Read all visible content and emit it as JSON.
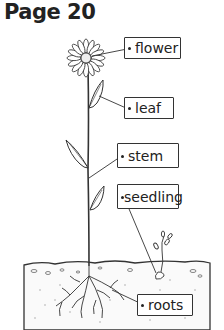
{
  "page": {
    "title": "Page 20"
  },
  "diagram": {
    "labels": [
      {
        "id": "flower",
        "text": "flower"
      },
      {
        "id": "leaf",
        "text": "leaf"
      },
      {
        "id": "stem",
        "text": "stem"
      },
      {
        "id": "seedling",
        "text": "seedling"
      },
      {
        "id": "roots",
        "text": "roots"
      }
    ]
  }
}
